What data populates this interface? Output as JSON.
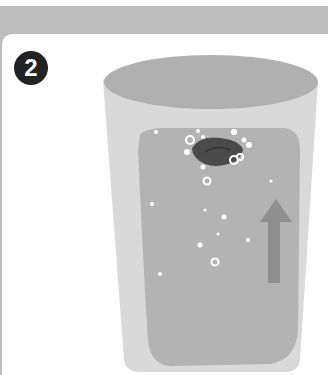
{
  "step": {
    "number": "2"
  },
  "illustration": {
    "subject": "glass-of-water-with-rising-bubbles",
    "colors": {
      "band": "#bdbdbd",
      "glass_outer": "#d9d9d9",
      "glass_rim": "#b0b0b0",
      "water": "#b3b3b3",
      "object": "#4a4a4a",
      "arrow": "#8f8f8f",
      "bubble": "#ffffff"
    },
    "arrow_direction": "up"
  }
}
